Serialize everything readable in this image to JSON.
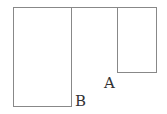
{
  "diagram": {
    "stroke_color": "#888888",
    "labels": {
      "a": "A",
      "b": "B"
    },
    "shapes": [
      {
        "name": "rectangle-b",
        "x": 13,
        "y": 7,
        "width": 58,
        "height": 99
      },
      {
        "name": "rectangle-a",
        "x": 117,
        "y": 7,
        "width": 39,
        "height": 65
      },
      {
        "name": "top-connector-line",
        "x1": 71,
        "y1": 7,
        "x2": 117,
        "y2": 7
      }
    ]
  }
}
